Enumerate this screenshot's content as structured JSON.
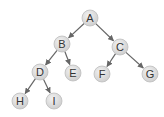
{
  "diagram": {
    "type": "binary-tree",
    "nodes": [
      {
        "id": "A",
        "label": "A",
        "x": 90,
        "y": 18
      },
      {
        "id": "B",
        "label": "B",
        "x": 62,
        "y": 44
      },
      {
        "id": "C",
        "label": "C",
        "x": 120,
        "y": 47
      },
      {
        "id": "D",
        "label": "D",
        "x": 40,
        "y": 72
      },
      {
        "id": "E",
        "label": "E",
        "x": 73,
        "y": 73
      },
      {
        "id": "F",
        "label": "F",
        "x": 102,
        "y": 74
      },
      {
        "id": "G",
        "label": "G",
        "x": 150,
        "y": 74
      },
      {
        "id": "H",
        "label": "H",
        "x": 20,
        "y": 101
      },
      {
        "id": "I",
        "label": "I",
        "x": 54,
        "y": 101
      }
    ],
    "edges": [
      {
        "from": "A",
        "to": "B"
      },
      {
        "from": "A",
        "to": "C"
      },
      {
        "from": "B",
        "to": "D"
      },
      {
        "from": "B",
        "to": "E"
      },
      {
        "from": "C",
        "to": "F"
      },
      {
        "from": "C",
        "to": "G"
      },
      {
        "from": "D",
        "to": "H"
      },
      {
        "from": "D",
        "to": "I"
      }
    ],
    "colors": {
      "node_fill": "#d9d9d9",
      "node_stroke": "#bdbdbd",
      "edge": "#666666",
      "label": "#333333"
    },
    "node_radius": 8
  }
}
